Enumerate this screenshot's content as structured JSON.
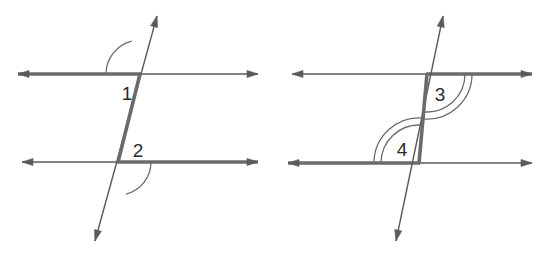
{
  "figure": {
    "canvas": {
      "width": 549,
      "height": 262,
      "background": "#ffffff"
    },
    "colors": {
      "line": "#5a5a5a",
      "bold_line": "#6b6b6b",
      "arc": "#6b6b6b",
      "label_text": "#2b2b2b"
    },
    "stroke_widths": {
      "thin": 1.4,
      "bold": 3.6,
      "arc": 1.3
    },
    "diagrams": [
      {
        "name": "left-diagram",
        "id": "diagram-1",
        "transversal": {
          "name": "transversal-line-left",
          "start": {
            "x": 95,
            "y": 241
          },
          "end": {
            "x": 157,
            "y": 16
          },
          "arrows": "both",
          "bold_segment": {
            "from": {
              "x": 118,
              "y": 162
            },
            "to": {
              "x": 140,
              "y": 74
            }
          }
        },
        "parallel_lines": [
          {
            "name": "top-parallel-line-left",
            "y": 74,
            "x_start": 18,
            "x_end": 258,
            "arrows": "both",
            "bold_from": 18,
            "bold_to": 141
          },
          {
            "name": "bottom-parallel-line-left",
            "y": 162,
            "x_start": 22,
            "x_end": 258,
            "arrows": "both",
            "bold_from": 117,
            "bold_to": 258
          }
        ],
        "intersections": [
          {
            "name": "upper-intersection-left",
            "x": 140,
            "y": 74
          },
          {
            "name": "lower-intersection-left",
            "x": 118,
            "y": 162
          }
        ],
        "angles": [
          {
            "name": "angle-1",
            "label": "1",
            "arc_count": 1,
            "vertex": {
              "x": 140,
              "y": 74
            },
            "radius": 34,
            "start_deg": 180,
            "end_deg": 256,
            "label_pos": {
              "x": 127,
              "y": 95
            }
          },
          {
            "name": "angle-2",
            "label": "2",
            "arc_count": 1,
            "vertex": {
              "x": 118,
              "y": 162
            },
            "radius": 33,
            "start_deg": 0,
            "end_deg": 76,
            "label_pos": {
              "x": 138,
              "y": 152
            }
          }
        ]
      },
      {
        "name": "right-diagram",
        "id": "diagram-2",
        "transversal": {
          "name": "transversal-line-right",
          "start": {
            "x": 396,
            "y": 241
          },
          "end": {
            "x": 443,
            "y": 16
          },
          "arrows": "both",
          "bold_segment": {
            "from": {
              "x": 419,
              "y": 163
            },
            "to": {
              "x": 427,
              "y": 74
            }
          }
        },
        "parallel_lines": [
          {
            "name": "top-parallel-line-right",
            "y": 74,
            "x_start": 292,
            "x_end": 532,
            "arrows": "both",
            "bold_from": 426,
            "bold_to": 532
          },
          {
            "name": "bottom-parallel-line-right",
            "y": 163,
            "x_start": 288,
            "x_end": 532,
            "arrows": "both",
            "bold_from": 288,
            "bold_to": 420
          }
        ],
        "intersections": [
          {
            "name": "upper-intersection-right",
            "x": 427,
            "y": 74
          },
          {
            "name": "lower-intersection-right",
            "x": 419,
            "y": 163
          }
        ],
        "angles": [
          {
            "name": "angle-3",
            "label": "3",
            "arc_count": 2,
            "vertex": {
              "x": 427,
              "y": 74
            },
            "radius": 38,
            "radius2": 45,
            "start_deg": 0,
            "end_deg": 95,
            "label_pos": {
              "x": 440,
              "y": 96
            }
          },
          {
            "name": "angle-4",
            "label": "4",
            "arc_count": 2,
            "vertex": {
              "x": 419,
              "y": 163
            },
            "radius": 38,
            "radius2": 45,
            "start_deg": 180,
            "end_deg": 275,
            "label_pos": {
              "x": 402,
              "y": 151
            }
          }
        ]
      }
    ]
  },
  "chart_data": {
    "type": "diagram",
    "labels": [
      "1",
      "2",
      "3",
      "4"
    ],
    "annotations": [
      {
        "label": "1",
        "arcs": 1,
        "diagram": "left",
        "position": "below-left of upper intersection"
      },
      {
        "label": "2",
        "arcs": 1,
        "diagram": "left",
        "position": "above-right of lower intersection"
      },
      {
        "label": "3",
        "arcs": 2,
        "diagram": "right",
        "position": "below-right of upper intersection"
      },
      {
        "label": "4",
        "arcs": 2,
        "diagram": "right",
        "position": "above-left of lower intersection"
      }
    ]
  }
}
